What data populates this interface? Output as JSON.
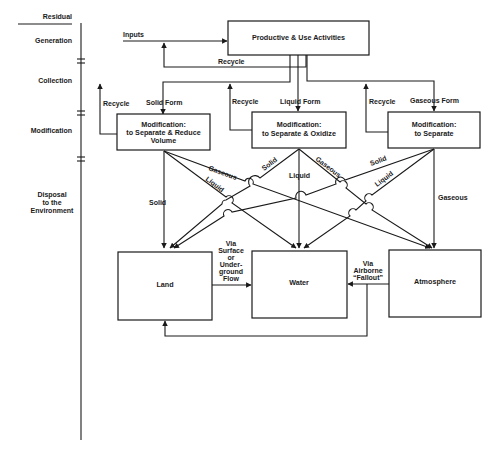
{
  "stages": {
    "header": "Residual",
    "generation": "Generation",
    "collection": "Collection",
    "modification": "Modification",
    "disposal_line1": "Disposal",
    "disposal_line2": "to the",
    "disposal_line3": "Environment"
  },
  "top": {
    "inputs_label": "Inputs",
    "box_label": "Productive & Use Activities",
    "recycle_label": "Recycle"
  },
  "forms": {
    "solid": "Solid Form",
    "liquid": "Liquid Form",
    "gaseous": "Gaseous Form",
    "recycle_left": "Recycle",
    "recycle_mid": "Recycle",
    "recycle_right": "Recycle"
  },
  "modification_boxes": [
    {
      "line1": "Modification:",
      "line2": "to Separate & Reduce",
      "line3": "Volume"
    },
    {
      "line1": "Modification:",
      "line2": "to Separate & Oxidize"
    },
    {
      "line1": "Modification:",
      "line2": "to Separate"
    }
  ],
  "flow_labels": {
    "left_gaseous": "Gaseous",
    "left_liquid": "Liquid",
    "left_solid": "Solid",
    "mid_solid": "Solid",
    "mid_liquid": "Liquid",
    "mid_gaseous": "Gaseous",
    "right_solid": "Solid",
    "right_liquid": "Liquid",
    "right_gaseous": "Gaseous"
  },
  "sinks": {
    "land": "Land",
    "water": "Water",
    "atmosphere": "Atmosphere"
  },
  "transfers": {
    "land_to_water": [
      "Via",
      "Surface",
      "or",
      "Under-",
      "ground",
      "Flow"
    ],
    "atmosphere_to_water": [
      "Via",
      "Airborne",
      "“Fallout”"
    ]
  }
}
